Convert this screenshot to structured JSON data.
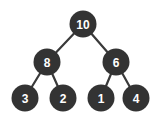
{
  "diagram": {
    "type": "binary-tree",
    "node_color": "#333333",
    "edge_color": "#3a3a3a",
    "label_color": "#ffffff",
    "nodes": [
      {
        "id": "n10",
        "label": "10",
        "cx": 83,
        "cy": 24,
        "r": 13.5
      },
      {
        "id": "n8",
        "label": "8",
        "cx": 47,
        "cy": 62,
        "r": 13.5
      },
      {
        "id": "n6",
        "label": "6",
        "cx": 116,
        "cy": 62,
        "r": 13.5
      },
      {
        "id": "n3",
        "label": "3",
        "cx": 25,
        "cy": 98,
        "r": 13.5
      },
      {
        "id": "n2",
        "label": "2",
        "cx": 63,
        "cy": 98,
        "r": 13.5
      },
      {
        "id": "n1",
        "label": "1",
        "cx": 101,
        "cy": 98,
        "r": 13.5
      },
      {
        "id": "n4",
        "label": "4",
        "cx": 136,
        "cy": 98,
        "r": 13.5
      }
    ],
    "edges": [
      {
        "from": "n10",
        "to": "n8"
      },
      {
        "from": "n10",
        "to": "n6"
      },
      {
        "from": "n8",
        "to": "n3"
      },
      {
        "from": "n8",
        "to": "n2"
      },
      {
        "from": "n6",
        "to": "n1"
      },
      {
        "from": "n6",
        "to": "n4"
      }
    ]
  }
}
